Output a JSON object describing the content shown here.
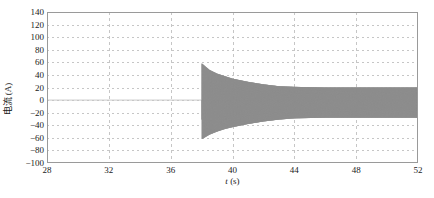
{
  "chart_data": {
    "type": "line",
    "title": "",
    "xlabel": "t (s)",
    "xlabel_italic_part": "t",
    "xlabel_unit_part": " (s)",
    "ylabel": "电流 (A)",
    "xlim": [
      28,
      52
    ],
    "ylim": [
      -100,
      140
    ],
    "xticks": [
      28,
      32,
      36,
      40,
      44,
      48,
      52
    ],
    "yticks": [
      -100,
      -80,
      -60,
      -40,
      -20,
      0,
      20,
      40,
      60,
      80,
      100,
      120,
      140
    ],
    "grid": "dashed-both-axes",
    "legend": null,
    "series": [
      {
        "name": "电流",
        "color": "#8c8c8c",
        "description": "Damped oscillating current: flat at 0 A until t=38 s, then a sudden oscillation burst with initial peaks of about +58 A and -62 A which decays exponentially toward a steady-state band of about +20 A to -28 A by t=44 s and holds to t=52 s.",
        "event_time": 38,
        "initial_peak_positive": 58,
        "initial_peak_negative": -62,
        "steady_state_positive": 20,
        "steady_state_negative": -28,
        "pre_event_value": 0,
        "oscillation_frequency_hz": 50,
        "decay_time_constant_s": 1.6,
        "envelope_positive": [
          {
            "t": 28,
            "v": 0
          },
          {
            "t": 38,
            "v": 0
          },
          {
            "t": 38.02,
            "v": 58
          },
          {
            "t": 38.5,
            "v": 48
          },
          {
            "t": 39,
            "v": 42
          },
          {
            "t": 39.5,
            "v": 38
          },
          {
            "t": 40,
            "v": 34
          },
          {
            "t": 41,
            "v": 29
          },
          {
            "t": 42,
            "v": 25
          },
          {
            "t": 43,
            "v": 22
          },
          {
            "t": 44,
            "v": 21
          },
          {
            "t": 46,
            "v": 20
          },
          {
            "t": 48,
            "v": 20
          },
          {
            "t": 50,
            "v": 20
          },
          {
            "t": 52,
            "v": 20
          }
        ],
        "envelope_negative": [
          {
            "t": 28,
            "v": 0
          },
          {
            "t": 38,
            "v": 0
          },
          {
            "t": 38.02,
            "v": -62
          },
          {
            "t": 38.5,
            "v": -55
          },
          {
            "t": 39,
            "v": -50
          },
          {
            "t": 39.5,
            "v": -46
          },
          {
            "t": 40,
            "v": -43
          },
          {
            "t": 41,
            "v": -38
          },
          {
            "t": 42,
            "v": -34
          },
          {
            "t": 43,
            "v": -31
          },
          {
            "t": 44,
            "v": -29
          },
          {
            "t": 46,
            "v": -28
          },
          {
            "t": 48,
            "v": -28
          },
          {
            "t": 50,
            "v": -28
          },
          {
            "t": 52,
            "v": -28
          }
        ]
      }
    ],
    "axes_color": "#9a9a9a",
    "grid_color": "#b8b8b8",
    "background": "#ffffff"
  }
}
